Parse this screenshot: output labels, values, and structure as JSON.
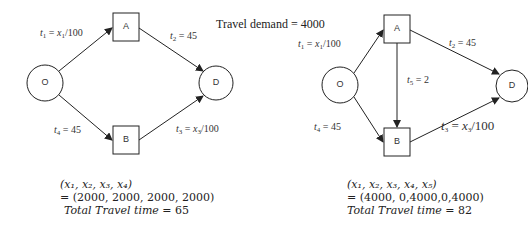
{
  "title": "Travel demand = 4000",
  "networks": [
    {
      "name": "without-link-5",
      "nodes": {
        "origin": "O",
        "a": "A",
        "b": "B",
        "destination": "D"
      },
      "links": {
        "t1": {
          "var": "t",
          "sub": "1",
          "eq": " = ",
          "x": "x",
          "xsub": "1",
          "rest": "/100"
        },
        "t2": {
          "var": "t",
          "sub": "2",
          "eq": " = 45"
        },
        "t3": {
          "var": "t",
          "sub": "3",
          "eq": " = ",
          "x": "x",
          "xsub": "3",
          "rest": "/100"
        },
        "t4": {
          "var": "t",
          "sub": "4",
          "eq": " = 45"
        }
      },
      "result": {
        "vector": "(x₁, x₂, x₃, x₄)",
        "flows": "= (2000, 2000, 2000, 2000)",
        "total_label": "Total Travel time",
        "total_eq": " =  65"
      }
    },
    {
      "name": "with-link-5",
      "nodes": {
        "origin": "O",
        "a": "A",
        "b": "B",
        "destination": "D"
      },
      "links": {
        "t1": {
          "var": "t",
          "sub": "1",
          "eq": " = ",
          "x": "x",
          "xsub": "1",
          "rest": "/100"
        },
        "t2": {
          "var": "t",
          "sub": "2",
          "eq": " = 45"
        },
        "t3": {
          "var": "t",
          "sub": "3",
          "eq": " = ",
          "x": "x",
          "xsub": "3",
          "rest": "/100"
        },
        "t4": {
          "var": "t",
          "sub": "4",
          "eq": " = 45"
        },
        "t5": {
          "var": "t",
          "sub": "5",
          "eq": " = 2"
        }
      },
      "result": {
        "vector": "(x₁, x₂, x₃, x₄, x₅)",
        "flows": "= (4000, 0,4000,0,4000)",
        "total_label": "Total Travel time",
        "total_eq": " =  82"
      }
    }
  ]
}
